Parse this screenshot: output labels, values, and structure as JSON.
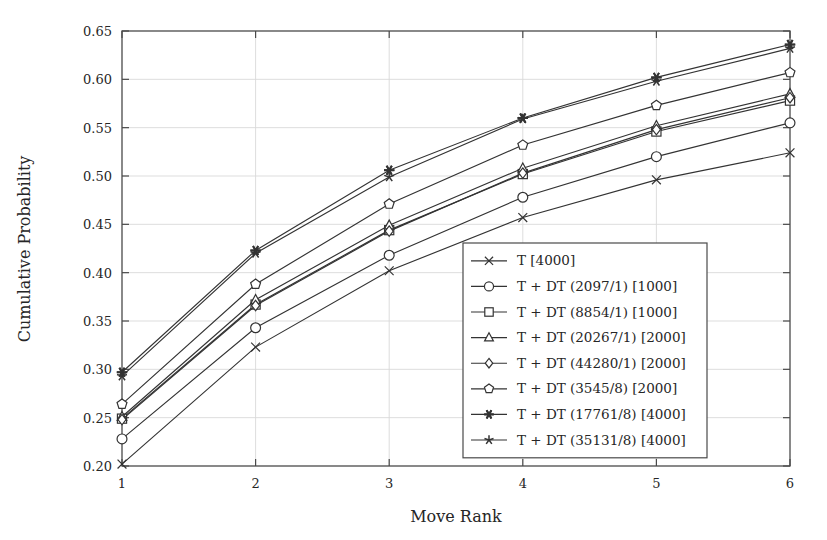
{
  "chart_data": {
    "type": "line",
    "title": "",
    "xlabel": "Move Rank",
    "ylabel": "Cumulative Probability",
    "x": [
      1,
      2,
      3,
      4,
      5,
      6
    ],
    "xlim": [
      1,
      6
    ],
    "ylim": [
      0.2,
      0.65
    ],
    "xticks": [
      "1",
      "2",
      "3",
      "4",
      "5",
      "6"
    ],
    "yticks": [
      "0.20",
      "0.25",
      "0.30",
      "0.35",
      "0.40",
      "0.45",
      "0.50",
      "0.55",
      "0.60",
      "0.65"
    ],
    "ytick_values": [
      0.2,
      0.25,
      0.3,
      0.35,
      0.4,
      0.45,
      0.5,
      0.55,
      0.6,
      0.65
    ],
    "grid": true,
    "legend_position": "lower right",
    "series": [
      {
        "name": "T [4000]",
        "marker": "x",
        "values": [
          0.202,
          0.323,
          0.402,
          0.457,
          0.496,
          0.524
        ]
      },
      {
        "name": "T + DT (2097/1) [1000]",
        "marker": "circle",
        "values": [
          0.228,
          0.343,
          0.418,
          0.478,
          0.52,
          0.555
        ]
      },
      {
        "name": "T + DT (8854/1) [1000]",
        "marker": "square",
        "values": [
          0.249,
          0.367,
          0.444,
          0.502,
          0.546,
          0.578
        ]
      },
      {
        "name": "T + DT (20267/1) [2000]",
        "marker": "triangle",
        "values": [
          0.251,
          0.372,
          0.449,
          0.508,
          0.552,
          0.585
        ]
      },
      {
        "name": "T + DT (44280/1) [2000]",
        "marker": "diamond",
        "values": [
          0.248,
          0.366,
          0.443,
          0.503,
          0.548,
          0.581
        ]
      },
      {
        "name": "T + DT (3545/8) [2000]",
        "marker": "pentagon",
        "values": [
          0.264,
          0.388,
          0.471,
          0.532,
          0.573,
          0.607
        ]
      },
      {
        "name": "T + DT (17761/8) [4000]",
        "marker": "asterisk",
        "values": [
          0.297,
          0.423,
          0.506,
          0.56,
          0.602,
          0.636
        ]
      },
      {
        "name": "T + DT (35131/8) [4000]",
        "marker": "star",
        "values": [
          0.293,
          0.42,
          0.499,
          0.559,
          0.598,
          0.632
        ]
      }
    ]
  },
  "axes": {
    "xlabel": "Move Rank",
    "ylabel": "Cumulative Probability"
  },
  "colors": {
    "line": "#333333",
    "grid": "#d9d9d9",
    "frame": "#4a4a4a",
    "background": "#ffffff"
  }
}
